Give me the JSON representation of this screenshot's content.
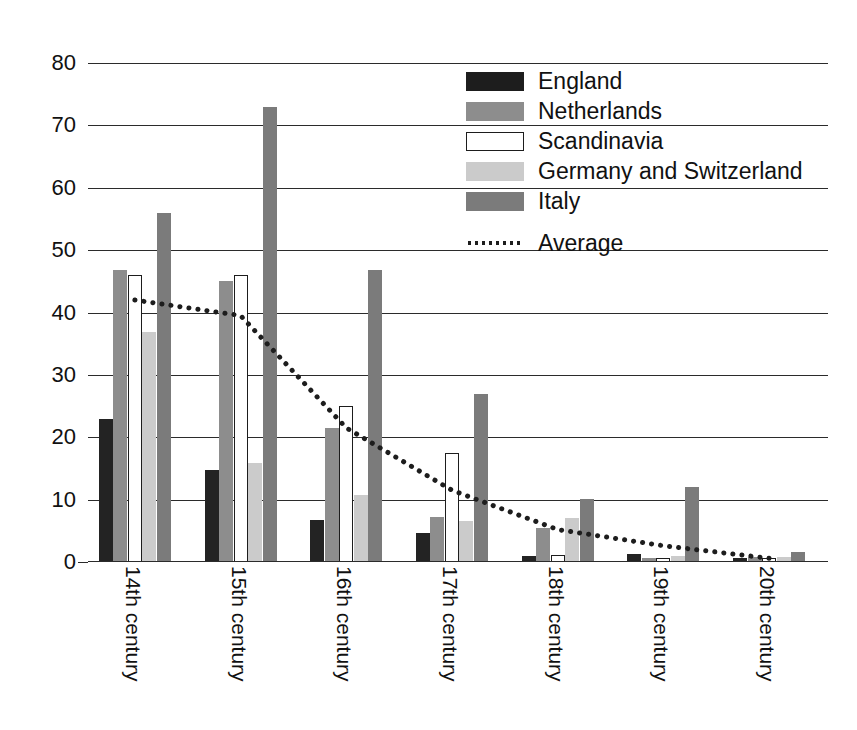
{
  "chart_data": {
    "type": "bar",
    "title": "",
    "subtitle": "",
    "xlabel": "",
    "ylabel": "",
    "ylim": [
      0,
      80
    ],
    "yticks": [
      0,
      10,
      20,
      30,
      40,
      50,
      60,
      70,
      80
    ],
    "grid": true,
    "legend_position": "top-right",
    "categories": [
      "14th century",
      "15th century",
      "16th century",
      "17th century",
      "18th century",
      "19th century",
      "20th century"
    ],
    "series": [
      {
        "name": "England",
        "color": "#232323",
        "values": [
          23,
          14.8,
          6.8,
          4.6,
          1.0,
          1.3,
          0.6
        ]
      },
      {
        "name": "Netherlands",
        "color": "#8d8d8d",
        "values": [
          46.8,
          45,
          21.5,
          7.2,
          5.4,
          0.6,
          0.8
        ]
      },
      {
        "name": "Scandinavia",
        "color": "#ffffff",
        "values": [
          46,
          46,
          25,
          17.5,
          1.1,
          0.7,
          0.7
        ]
      },
      {
        "name": "Germany and Switzerland",
        "color": "#cbcbcb",
        "values": [
          36.8,
          15.8,
          10.8,
          6.6,
          7.0,
          0.9,
          0.8
        ]
      },
      {
        "name": "Italy",
        "color": "#7b7b7b",
        "values": [
          56,
          73,
          46.8,
          27,
          10.1,
          12,
          1.6
        ]
      }
    ],
    "overlay": {
      "name": "Average",
      "style": "dotted",
      "color": "#1d1d1d",
      "values": [
        42,
        39.5,
        21.5,
        11.5,
        5.2,
        2.6,
        0.6
      ]
    }
  },
  "legend": {
    "items": [
      {
        "label": "England",
        "swatch": "s-england"
      },
      {
        "label": "Netherlands",
        "swatch": "s-netherlands"
      },
      {
        "label": "Scandinavia",
        "swatch": "s-scandinavia"
      },
      {
        "label": "Germany and Switzerland",
        "swatch": "s-germany"
      },
      {
        "label": "Italy",
        "swatch": "s-italy"
      }
    ],
    "average": {
      "label": "Average",
      "swatch": "s-average"
    }
  }
}
